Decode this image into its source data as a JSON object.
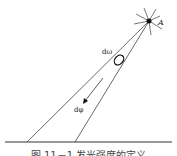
{
  "diagram": {
    "labels": {
      "source": "A",
      "solid_angle": "dω",
      "flux": "dφ"
    },
    "caption": "图 11－1  发光强度的定义"
  }
}
